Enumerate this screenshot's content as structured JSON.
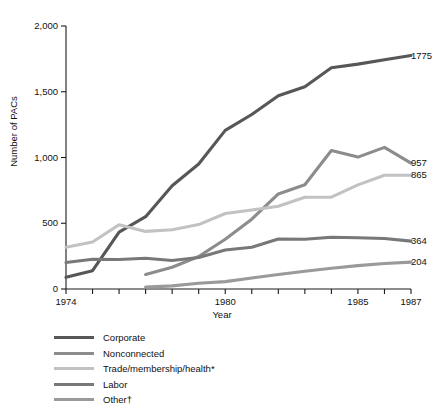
{
  "chart_data": {
    "type": "line",
    "title": "",
    "xlabel": "Year",
    "ylabel": "Number of PACs",
    "xlim": [
      1974,
      1987
    ],
    "ylim": [
      0,
      2000
    ],
    "grid": false,
    "legend_position": "bottom-left",
    "x": [
      1974,
      1975,
      1976,
      1977,
      1978,
      1979,
      1980,
      1981,
      1982,
      1983,
      1984,
      1985,
      1986,
      1987
    ],
    "xticks": [
      1974,
      1975,
      1976,
      1977,
      1978,
      1979,
      1980,
      1981,
      1982,
      1983,
      1984,
      1985,
      1986,
      1987
    ],
    "xtick_labels": [
      "1974",
      "1980",
      "1985",
      "1987"
    ],
    "yticks": [
      0,
      500,
      1000,
      1500,
      2000
    ],
    "ytick_labels": [
      "0",
      "500",
      "1,000",
      "1,500",
      "2,000"
    ],
    "series": [
      {
        "name": "Corporate",
        "color": "#575757",
        "end_label": "1775",
        "values": [
          89,
          139,
          433,
          550,
          785,
          950,
          1206,
          1327,
          1469,
          1538,
          1682,
          1710,
          1744,
          1775
        ]
      },
      {
        "name": "Nonconnected",
        "color": "#8c8c8c",
        "end_label": "957",
        "values": [
          null,
          null,
          null,
          110,
          165,
          247,
          378,
          531,
          723,
          793,
          1053,
          1003,
          1077,
          957
        ]
      },
      {
        "name": "Trade/membership/health*",
        "color": "#c2c2c2",
        "end_label": "865",
        "values": [
          318,
          357,
          489,
          438,
          451,
          490,
          574,
          601,
          629,
          698,
          698,
          792,
          865,
          865
        ]
      },
      {
        "name": "Labor",
        "color": "#787878",
        "end_label": "364",
        "values": [
          201,
          226,
          224,
          234,
          217,
          240,
          297,
          318,
          380,
          378,
          394,
          390,
          384,
          364
        ]
      },
      {
        "name": "Other†",
        "color": "#9a9a9a",
        "end_label": "204",
        "values": [
          null,
          null,
          null,
          14,
          24,
          44,
          56,
          84,
          110,
          135,
          158,
          178,
          194,
          204
        ]
      }
    ]
  },
  "legend": {
    "items": [
      {
        "label": "Corporate",
        "color": "#575757"
      },
      {
        "label": "Nonconnected",
        "color": "#8c8c8c"
      },
      {
        "label": "Trade/membership/health*",
        "color": "#c2c2c2"
      },
      {
        "label": "Labor",
        "color": "#787878"
      },
      {
        "label": "Other†",
        "color": "#9a9a9a"
      }
    ]
  }
}
